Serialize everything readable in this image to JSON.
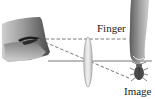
{
  "diagram": {
    "type": "optics-lens-ray-diagram",
    "labels": {
      "finger": "Finger",
      "image": "Image"
    },
    "elements": [
      {
        "name": "eye",
        "icon": "eye-icon"
      },
      {
        "name": "converging-lens",
        "icon": "lens-icon"
      },
      {
        "name": "finger",
        "icon": "finger-icon"
      },
      {
        "name": "bug-image",
        "icon": "bug-icon"
      }
    ],
    "lines": [
      {
        "name": "sight-line-to-finger",
        "style": "dashed"
      },
      {
        "name": "sight-line-through-lens",
        "style": "dashed"
      },
      {
        "name": "optical-axis",
        "style": "solid"
      }
    ],
    "colors": {
      "line": "#555555",
      "lens_fill": "#e8e8e8",
      "lens_stroke": "#8a8a8a",
      "skin_dark": "#5a5a5a",
      "skin_light": "#d8d8d8",
      "text": "#1a1a1a"
    }
  }
}
